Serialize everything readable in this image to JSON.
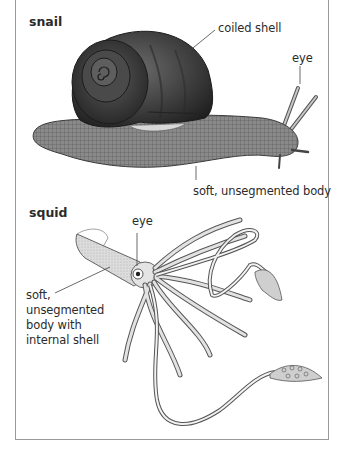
{
  "figure": {
    "sections": [
      {
        "title": "snail",
        "labels": {
          "shell": "coiled shell",
          "eye": "eye",
          "body": "soft, unsegmented body"
        }
      },
      {
        "title": "squid",
        "labels": {
          "eye": "eye",
          "body_lines": [
            "soft,",
            "unsegmented",
            "body with",
            "internal shell"
          ]
        }
      }
    ]
  }
}
